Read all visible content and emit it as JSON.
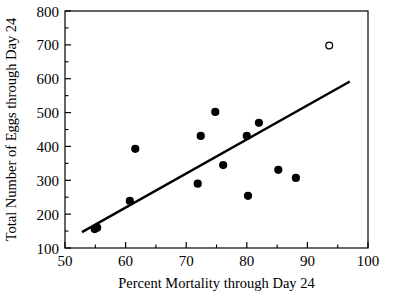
{
  "chart_data": {
    "type": "scatter",
    "title": "",
    "xlabel": "Percent Mortality through Day 24",
    "ylabel": "Total Number of Eggs through Day 24",
    "xlim": [
      50,
      100
    ],
    "ylim": [
      100,
      800
    ],
    "xticks": [
      50,
      60,
      70,
      80,
      90,
      100
    ],
    "yticks": [
      100,
      200,
      300,
      400,
      500,
      600,
      700,
      800
    ],
    "xtick_labels": [
      "50",
      "60",
      "70",
      "80",
      "90",
      "100"
    ],
    "ytick_labels": [
      "100",
      "200",
      "300",
      "400",
      "500",
      "600",
      "700",
      "800"
    ],
    "grid": false,
    "legend": null,
    "minor_ticks": true,
    "frame": "box",
    "series": [
      {
        "name": "Observations",
        "marker": "filled-circle",
        "color": "#000000",
        "points": [
          {
            "x": 54.9,
            "y": 156
          },
          {
            "x": 55.3,
            "y": 160
          },
          {
            "x": 61.6,
            "y": 393
          },
          {
            "x": 60.7,
            "y": 239
          },
          {
            "x": 71.9,
            "y": 290
          },
          {
            "x": 72.4,
            "y": 431
          },
          {
            "x": 74.8,
            "y": 502
          },
          {
            "x": 76.1,
            "y": 345
          },
          {
            "x": 80.0,
            "y": 431
          },
          {
            "x": 80.2,
            "y": 254
          },
          {
            "x": 82.0,
            "y": 470
          },
          {
            "x": 85.2,
            "y": 331
          },
          {
            "x": 88.1,
            "y": 307
          }
        ]
      },
      {
        "name": "Excluded outlier",
        "marker": "open-circle",
        "color": "#000000",
        "points": [
          {
            "x": 93.6,
            "y": 698
          }
        ]
      }
    ],
    "fit_line": {
      "name": "Regression line",
      "color": "#000000",
      "x_start": 52.8,
      "y_start": 147,
      "x_end": 97.0,
      "y_end": 592
    }
  },
  "axes": {
    "x_title": "Percent Mortality through Day 24",
    "y_title": "Total Number of Eggs through Day 24"
  }
}
